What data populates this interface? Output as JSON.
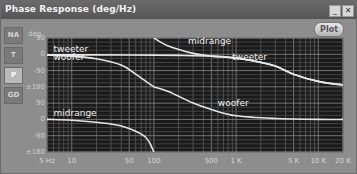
{
  "window": {
    "title": "Phase Response (deg/Hz)",
    "minimize_icon": "minimize-icon",
    "close_icon": "close-icon",
    "plot_button": "Plot"
  },
  "tabs": [
    {
      "label": "NA",
      "active": false
    },
    {
      "label": "T",
      "active": false
    },
    {
      "label": "P",
      "active": true
    },
    {
      "label": "GD",
      "active": false
    }
  ],
  "chart_data": {
    "type": "line",
    "title": "Phase Response (deg/Hz)",
    "xlabel": "Hz",
    "ylabel": "deg",
    "x_scale": "log",
    "xlim": [
      5,
      20000
    ],
    "ylim": [
      -540,
      90
    ],
    "phase_wrap": "±180",
    "x_ticks": [
      {
        "value": 5,
        "label": "5 Hz"
      },
      {
        "value": 10,
        "label": "10"
      },
      {
        "value": 50,
        "label": "50"
      },
      {
        "value": 100,
        "label": "100"
      },
      {
        "value": 500,
        "label": "500"
      },
      {
        "value": 1000,
        "label": "1 K"
      },
      {
        "value": 5000,
        "label": "5 K"
      },
      {
        "value": 10000,
        "label": "10 K"
      },
      {
        "value": 20000,
        "label": "20 K"
      }
    ],
    "y_header": "deg",
    "y_ticks": [
      {
        "value": 90,
        "label": "90"
      },
      {
        "value": 0,
        "label": "0"
      },
      {
        "value": -90,
        "label": "-90"
      },
      {
        "value": -180,
        "label": "±180"
      },
      {
        "value": -270,
        "label": "90"
      },
      {
        "value": -360,
        "label": "0"
      },
      {
        "value": -450,
        "label": "-90"
      },
      {
        "value": -540,
        "label": "±180"
      }
    ],
    "grid": true,
    "series": [
      {
        "name": "tweeter",
        "segments": [
          {
            "x": [
              5,
              50,
              200,
              500,
              1000,
              2000,
              3000,
              5000,
              10000,
              20000
            ],
            "y": [
              -3,
              -4,
              -6,
              -10,
              -20,
              -45,
              -65,
              -110,
              -150,
              -170
            ]
          }
        ]
      },
      {
        "name": "midrange",
        "segments": [
          {
            "x": [
              100,
              150,
              300,
              500,
              1000,
              2000,
              3000,
              5000,
              10000,
              20000
            ],
            "y": [
              90,
              45,
              5,
              -10,
              -22,
              -45,
              -65,
              -110,
              -150,
              -170
            ]
          },
          {
            "x": [
              5,
              10,
              30,
              50,
              80,
              100
            ],
            "y": [
              -360,
              -365,
              -385,
              -410,
              -460,
              -540
            ]
          }
        ]
      },
      {
        "name": "woofer",
        "segments": [
          {
            "x": [
              5,
              10,
              20,
              40,
              60,
              80,
              100
            ],
            "y": [
              -5,
              -10,
              -25,
              -60,
              -110,
              -150,
              -180
            ]
          },
          {
            "x": [
              100,
              150,
              300,
              500,
              1000,
              3000,
              10000,
              20000
            ],
            "y": [
              -180,
              -205,
              -270,
              -305,
              -340,
              -355,
              -360,
              -360
            ]
          }
        ]
      }
    ],
    "annotations": [
      {
        "text": "tweeter",
        "x": 6,
        "y": 10
      },
      {
        "text": "woofer",
        "x": 6,
        "y": -30
      },
      {
        "text": "midrange",
        "x": 260,
        "y": 55
      },
      {
        "text": "tweeter",
        "x": 900,
        "y": -30
      },
      {
        "text": "woofer",
        "x": 600,
        "y": -285
      },
      {
        "text": "midrange",
        "x": 6,
        "y": -340
      }
    ]
  }
}
